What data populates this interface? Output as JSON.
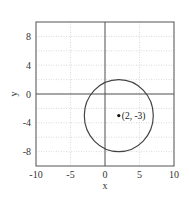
{
  "chart_data": {
    "type": "scatter",
    "title": "",
    "xlabel": "x",
    "ylabel": "y",
    "xlim": [
      -10,
      10
    ],
    "ylim": [
      -10,
      10
    ],
    "grid": true,
    "x_ticks": [
      -10,
      -5,
      0,
      5,
      10
    ],
    "y_ticks": [
      -8,
      -4,
      0,
      4,
      8
    ],
    "x_tick_labels": [
      "-10",
      "-5",
      "0",
      "5",
      "10"
    ],
    "y_tick_labels": [
      "-8",
      "-4",
      "0",
      "4",
      "8"
    ],
    "shapes": [
      {
        "kind": "circle",
        "center": [
          2,
          -3
        ],
        "radius": 5
      }
    ],
    "points": [
      {
        "x": 2,
        "y": -3,
        "label": "(2, -3)"
      }
    ],
    "annotation": "(2, -3)",
    "axes_lines": {
      "x": 0,
      "y": 0
    }
  }
}
